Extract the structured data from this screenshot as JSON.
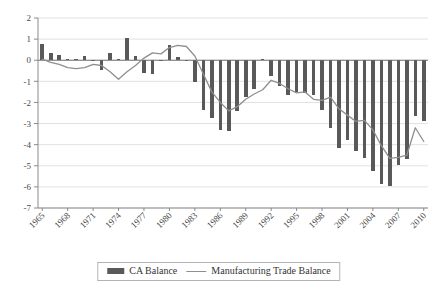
{
  "chart_data": {
    "type": "bar",
    "title": "",
    "xlabel": "",
    "ylabel": "",
    "ylim": [
      -7,
      2
    ],
    "ytick_values": [
      2,
      1,
      0,
      -1,
      -2,
      -3,
      -4,
      -5,
      -6,
      -7
    ],
    "ytick_labels": [
      "2",
      "1",
      "0",
      "-1",
      "-2",
      "-3",
      "-4",
      "-5",
      "-6",
      "-7"
    ],
    "grid": true,
    "legend_position": "bottom-center",
    "xtick_labels": [
      "1965",
      "1968",
      "1971",
      "1974",
      "1977",
      "1980",
      "1983",
      "1986",
      "1989",
      "1992",
      "1995",
      "1998",
      "2001",
      "2004",
      "2007",
      "2010"
    ],
    "xtick_step": 3,
    "x": [
      1965,
      1966,
      1967,
      1968,
      1969,
      1970,
      1971,
      1972,
      1973,
      1974,
      1975,
      1976,
      1977,
      1978,
      1979,
      1980,
      1981,
      1982,
      1983,
      1984,
      1985,
      1986,
      1987,
      1988,
      1989,
      1990,
      1991,
      1992,
      1993,
      1994,
      1995,
      1996,
      1997,
      1998,
      1999,
      2000,
      2001,
      2002,
      2003,
      2004,
      2005,
      2006,
      2007,
      2008,
      2009,
      2010
    ],
    "series": [
      {
        "name": "CA Balance",
        "chart_type": "bar",
        "color": "#595959",
        "values": [
          0.75,
          0.33,
          0.25,
          0.05,
          0.05,
          0.2,
          -0.05,
          -0.45,
          0.35,
          0.05,
          1.07,
          0.2,
          -0.6,
          -0.65,
          0.0,
          0.7,
          0.15,
          -0.05,
          -1.05,
          -2.35,
          -2.75,
          -3.3,
          -3.35,
          -2.4,
          -1.75,
          -1.35,
          0.05,
          -0.75,
          -1.2,
          -1.65,
          -1.5,
          -1.55,
          -1.65,
          -2.35,
          -3.2,
          -4.15,
          -3.8,
          -4.3,
          -4.65,
          -5.25,
          -5.85,
          -5.95,
          -4.95,
          -4.7,
          -2.65,
          -2.9
        ]
      },
      {
        "name": "Manufacturing Trade Balance",
        "chart_type": "line",
        "color": "#8f8f8f",
        "values": [
          0.05,
          -0.1,
          -0.2,
          -0.35,
          -0.4,
          -0.35,
          -0.2,
          -0.25,
          -0.55,
          -0.9,
          -0.55,
          -0.25,
          0.1,
          0.35,
          0.3,
          0.6,
          0.7,
          0.65,
          0.2,
          -0.65,
          -1.5,
          -2.0,
          -2.4,
          -2.2,
          -1.85,
          -1.6,
          -1.4,
          -0.95,
          -1.1,
          -1.35,
          -1.55,
          -1.5,
          -1.85,
          -1.9,
          -1.75,
          -2.3,
          -2.6,
          -2.9,
          -2.85,
          -3.3,
          -4.05,
          -4.65,
          -4.6,
          -4.5,
          -3.2,
          -3.85
        ]
      }
    ]
  },
  "legend": {
    "items": [
      {
        "label": "CA Balance",
        "marker": "bar-swatch",
        "color": "#595959"
      },
      {
        "label": "Manufacturing Trade Balance",
        "marker": "line-swatch",
        "color": "#8f8f8f"
      }
    ]
  }
}
